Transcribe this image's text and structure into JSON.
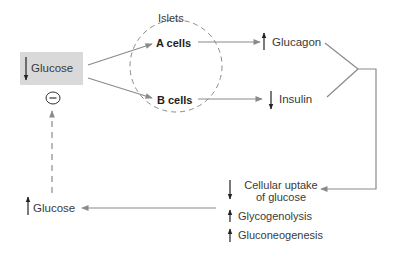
{
  "diagram": {
    "islets_label": "Islets",
    "nodes": {
      "glucose_low": {
        "label": "Glucose",
        "direction": "down"
      },
      "inhibit_symbol": "−",
      "a_cells": {
        "label": "A cells"
      },
      "b_cells": {
        "label": "B cells"
      },
      "glucagon": {
        "label": "Glucagon",
        "direction": "up"
      },
      "insulin": {
        "label": "Insulin",
        "direction": "down"
      },
      "cellular_uptake": {
        "line1": "Cellular uptake",
        "line2": "of glucose",
        "direction": "down"
      },
      "glycogenolysis": {
        "label": "Glycogenolysis",
        "direction": "up"
      },
      "gluconeogenesis": {
        "label": "Gluconeogenesis",
        "direction": "up"
      },
      "glucose_high": {
        "label": "Glucose",
        "direction": "up"
      }
    },
    "edges": [
      {
        "from": "glucose_low",
        "to": "a_cells",
        "style": "solid"
      },
      {
        "from": "glucose_low",
        "to": "b_cells",
        "style": "solid"
      },
      {
        "from": "a_cells",
        "to": "glucagon",
        "style": "solid"
      },
      {
        "from": "b_cells",
        "to": "insulin",
        "style": "solid"
      },
      {
        "from": "glucagon+insulin",
        "to": "cellular_uptake",
        "style": "solid"
      },
      {
        "from": "effects",
        "to": "glucose_high",
        "style": "solid"
      },
      {
        "from": "glucose_high",
        "to": "glucose_low",
        "style": "dashed",
        "label": "negative feedback"
      }
    ],
    "colors": {
      "line": "#8a8a8a",
      "box": "#d9d9d9",
      "text": "#333333"
    }
  }
}
